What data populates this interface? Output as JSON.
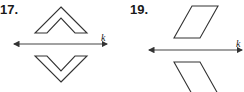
{
  "problems": [
    {
      "number": "17.",
      "line_label": "k",
      "shape": "chevron",
      "description": "Chevron shape above line k and its reflection below line k"
    },
    {
      "number": "19.",
      "line_label": "k",
      "shape": "parallelogram",
      "description": "Parallelogram above line k and its reflection below line k"
    }
  ],
  "colors": {
    "stroke": "#333333",
    "text": "#1a1a1a"
  }
}
